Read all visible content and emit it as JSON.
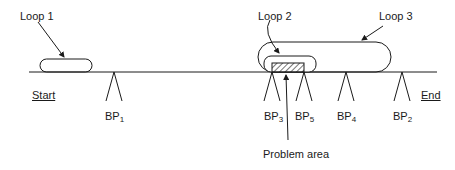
{
  "diagram": {
    "loops": [
      {
        "label": "Loop 1"
      },
      {
        "label": "Loop 2"
      },
      {
        "label": "Loop 3"
      }
    ],
    "endpoints": {
      "start": "Start",
      "end": "End"
    },
    "breakpoints": [
      {
        "base": "BP",
        "sub": "1"
      },
      {
        "base": "BP",
        "sub": "3"
      },
      {
        "base": "BP",
        "sub": "5"
      },
      {
        "base": "BP",
        "sub": "4"
      },
      {
        "base": "BP",
        "sub": "2"
      }
    ],
    "problem_label": "Problem area"
  }
}
